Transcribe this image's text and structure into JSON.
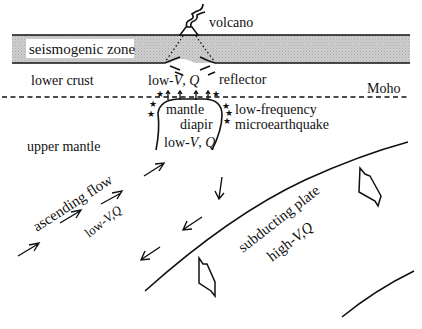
{
  "diagram": {
    "type": "geological cross-section schematic",
    "layers": {
      "seismogenic_zone": "seismogenic zone",
      "lower_crust": "lower crust",
      "moho": "Moho",
      "upper_mantle": "upper mantle"
    },
    "features": {
      "volcano": "volcano",
      "reflector": "reflector",
      "low_vq_crust_prefix": "low-",
      "low_vq_crust_v": "V",
      "low_vq_crust_sep": ", ",
      "low_vq_crust_q": "Q",
      "mantle_diapir_line1": "mantle",
      "mantle_diapir_line2": "diapir",
      "diapir_low_prefix": "low-",
      "diapir_low_v": "V",
      "diapir_low_sep": ", ",
      "diapir_low_q": "Q",
      "lf_quake_line1": "low-frequency",
      "lf_quake_line2": "microearthquake",
      "ascending_flow": "ascending flow",
      "ascending_low_prefix": "low-",
      "ascending_low_vq": "V,Q",
      "subducting_plate": "subducting plate",
      "plate_high_prefix": "high-",
      "plate_high_vq": "V,Q"
    },
    "colors": {
      "seismogenic_fill": "#c8c8c8",
      "ink": "#111111",
      "background": "#ffffff"
    }
  }
}
